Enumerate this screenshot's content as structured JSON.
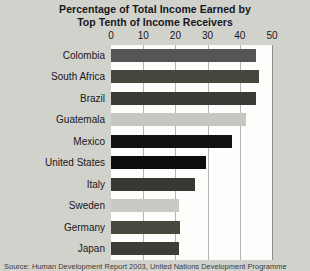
{
  "chart_data": {
    "type": "bar",
    "orientation": "horizontal",
    "title": "Percentage of Total Income Earned by Top Tenth of Income Receivers",
    "title_lines": [
      "Percentage of Total Income Earned by",
      "Top Tenth of Income Receivers"
    ],
    "xlabel": "",
    "ylabel": "",
    "xlim": [
      0,
      50
    ],
    "xticks": [
      0,
      10,
      20,
      30,
      40,
      50
    ],
    "xtick_labels": [
      "0",
      "10",
      "20",
      "30",
      "40",
      "50"
    ],
    "grid": true,
    "grid_axis": "x",
    "legend": false,
    "categories": [
      "Colombia",
      "South Africa",
      "Brazil",
      "Guatemala",
      "Mexico",
      "United States",
      "Italy",
      "Sweden",
      "Germany",
      "Japan"
    ],
    "values": [
      45,
      46,
      45,
      42,
      37.5,
      29.5,
      26,
      21,
      21.5,
      21
    ],
    "bar_colors": [
      "#555553",
      "#46463f",
      "#3a3a36",
      "#c6c6c2",
      "#121212",
      "#0d0d0d",
      "#373734",
      "#c9c9c5",
      "#48483f",
      "#3c3c38"
    ]
  },
  "caption": {
    "source_text": "Source: Human Development Report 2003, United Nations Development Programme"
  },
  "colors": {
    "background": "#d2d2cd",
    "plot_background": "#fdfdfb",
    "gridline": "#b4b4b4",
    "axis_border": "#8d8d8d",
    "text": "#17171a"
  }
}
